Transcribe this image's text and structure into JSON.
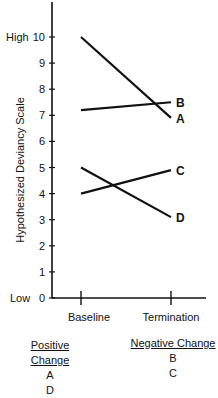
{
  "chart_data": {
    "type": "line",
    "title": "",
    "xlabel": "",
    "ylabel": "Hypothesized Deviancy Scale",
    "ylim": [
      0,
      10
    ],
    "y_ticks": [
      0,
      1,
      2,
      3,
      4,
      5,
      6,
      7,
      8,
      9,
      10
    ],
    "y_tick_labels": [
      "0",
      "1",
      "2",
      "3",
      "4",
      "5",
      "6",
      "7",
      "8",
      "9",
      "10"
    ],
    "y_anchor_labels": {
      "high": "High",
      "low": "Low"
    },
    "categories": [
      "Baseline",
      "Termination"
    ],
    "grid": false,
    "series": [
      {
        "name": "A",
        "values": [
          10,
          6.9
        ]
      },
      {
        "name": "B",
        "values": [
          7.2,
          7.5
        ]
      },
      {
        "name": "C",
        "values": [
          4,
          4.9
        ]
      },
      {
        "name": "D",
        "values": [
          5,
          3.1
        ]
      }
    ],
    "legend_groups": [
      {
        "heading": "Positive Change",
        "members": [
          "A",
          "D"
        ]
      },
      {
        "heading": "Negative Change",
        "members": [
          "B",
          "C"
        ]
      }
    ]
  },
  "labels": {
    "high": "High",
    "low": "Low",
    "ylabel": "Hypothesized Deviancy Scale",
    "x0": "Baseline",
    "x1": "Termination"
  },
  "legend": {
    "positive": {
      "heading": "Positive Change",
      "items": [
        "A",
        "D"
      ]
    },
    "negative": {
      "heading": "Negative Change",
      "items": [
        "B",
        "C"
      ]
    }
  }
}
